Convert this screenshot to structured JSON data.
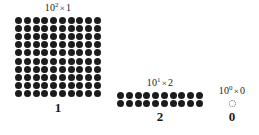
{
  "figure": {
    "number": "120",
    "base": 10,
    "dot_color": "#1c1c1c",
    "background_color": "#ffffff",
    "empty_dot_color": "#6f6f6f"
  },
  "groups": [
    {
      "id": "hundreds",
      "power_base": "10",
      "power_exponent": "2",
      "times_symbol": "×",
      "multiplier": "1",
      "label_text": "10² × 1",
      "digit": "1",
      "rows": 10,
      "columns": 10,
      "dot_count": 100,
      "filled": true
    },
    {
      "id": "tens",
      "power_base": "10",
      "power_exponent": "1",
      "times_symbol": "×",
      "multiplier": "2",
      "label_text": "10¹ × 2",
      "digit": "2",
      "rows": 2,
      "columns": 10,
      "dot_count": 20,
      "filled": true
    },
    {
      "id": "ones",
      "power_base": "10",
      "power_exponent": "0",
      "times_symbol": "×",
      "multiplier": "0",
      "label_text": "10⁰ × 0",
      "digit": "0",
      "rows": 1,
      "columns": 1,
      "dot_count": 0,
      "filled": false
    }
  ]
}
